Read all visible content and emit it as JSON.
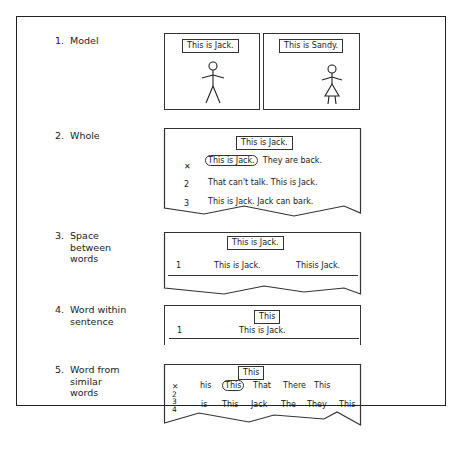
{
  "steps": [
    {
      "num": "1.",
      "label": "Model"
    },
    {
      "num": "2.",
      "label": "Whole"
    },
    {
      "num": "3.",
      "label": "Space between words",
      "lines": [
        "Space",
        "between",
        "words"
      ]
    },
    {
      "num": "4.",
      "label": "Word within sentence",
      "lines": [
        "Word within",
        "sentence"
      ]
    },
    {
      "num": "5.",
      "label": "Word from similar words",
      "lines": [
        "Word from",
        "similar",
        "words"
      ]
    }
  ],
  "model": {
    "left": {
      "caption": "This is Jack.",
      "figure": "boy-stick-figure"
    },
    "right": {
      "caption": "This is Sandy.",
      "figure": "girl-stick-figure"
    }
  },
  "whole": {
    "target": "This is Jack.",
    "rows": [
      {
        "marker": "✕",
        "circled": "This is Jack.",
        "rest": "They are back."
      },
      {
        "marker": "2",
        "text": "That can't talk.  This is Jack."
      },
      {
        "marker": "3",
        "text": "This is Jack.  Jack can bark."
      }
    ]
  },
  "space": {
    "target": "This is Jack.",
    "row": {
      "marker": "1",
      "option_a": "This is Jack.",
      "option_b": "Thisis Jack."
    }
  },
  "within": {
    "target": "This",
    "row": {
      "marker": "1",
      "text": "This is Jack."
    }
  },
  "similar": {
    "target": "This",
    "markers": [
      "✕",
      "2",
      "3",
      "4"
    ],
    "row1": [
      "his",
      "This",
      "That",
      "There",
      "This"
    ],
    "row1_circled_index": 1,
    "row2": [
      "is",
      "This",
      "Jack",
      "The",
      "They",
      "This"
    ]
  }
}
